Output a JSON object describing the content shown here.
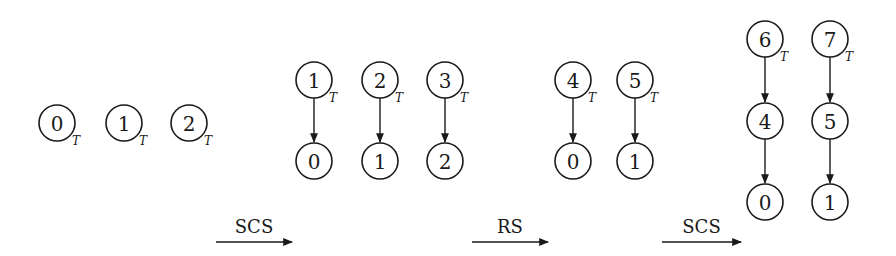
{
  "diagram": {
    "colors": {
      "stroke": "#1a1a1a",
      "fill": "#ffffff"
    },
    "node_radius": 18,
    "tag_text": "T",
    "stages": [
      {
        "name": "stage-0",
        "nodes": [
          {
            "id": "s0-n0",
            "label": "0",
            "x": 57,
            "y": 123,
            "tagged": true
          },
          {
            "id": "s0-n1",
            "label": "1",
            "x": 124,
            "y": 123,
            "tagged": true
          },
          {
            "id": "s0-n2",
            "label": "2",
            "x": 189,
            "y": 123,
            "tagged": true
          }
        ],
        "edges": []
      },
      {
        "name": "stage-1",
        "nodes": [
          {
            "id": "s1-n1",
            "label": "1",
            "x": 314,
            "y": 80,
            "tagged": true
          },
          {
            "id": "s1-n2",
            "label": "2",
            "x": 380,
            "y": 80,
            "tagged": true
          },
          {
            "id": "s1-n3",
            "label": "3",
            "x": 445,
            "y": 80,
            "tagged": true
          },
          {
            "id": "s1-n0",
            "label": "0",
            "x": 314,
            "y": 161,
            "tagged": false
          },
          {
            "id": "s1-n1b",
            "label": "1",
            "x": 380,
            "y": 161,
            "tagged": false
          },
          {
            "id": "s1-n2b",
            "label": "2",
            "x": 445,
            "y": 161,
            "tagged": false
          }
        ],
        "edges": [
          {
            "from": "s1-n1",
            "to": "s1-n0"
          },
          {
            "from": "s1-n2",
            "to": "s1-n1b"
          },
          {
            "from": "s1-n3",
            "to": "s1-n2b"
          }
        ]
      },
      {
        "name": "stage-2",
        "nodes": [
          {
            "id": "s2-n4",
            "label": "4",
            "x": 573,
            "y": 80,
            "tagged": true
          },
          {
            "id": "s2-n5",
            "label": "5",
            "x": 635,
            "y": 80,
            "tagged": true
          },
          {
            "id": "s2-n0",
            "label": "0",
            "x": 573,
            "y": 161,
            "tagged": false
          },
          {
            "id": "s2-n1",
            "label": "1",
            "x": 635,
            "y": 161,
            "tagged": false
          }
        ],
        "edges": [
          {
            "from": "s2-n4",
            "to": "s2-n0"
          },
          {
            "from": "s2-n5",
            "to": "s2-n1"
          }
        ]
      },
      {
        "name": "stage-3",
        "nodes": [
          {
            "id": "s3-n6",
            "label": "6",
            "x": 765,
            "y": 39,
            "tagged": true
          },
          {
            "id": "s3-n7",
            "label": "7",
            "x": 830,
            "y": 39,
            "tagged": true
          },
          {
            "id": "s3-n4",
            "label": "4",
            "x": 765,
            "y": 121,
            "tagged": false
          },
          {
            "id": "s3-n5",
            "label": "5",
            "x": 830,
            "y": 121,
            "tagged": false
          },
          {
            "id": "s3-n0",
            "label": "0",
            "x": 765,
            "y": 202,
            "tagged": false
          },
          {
            "id": "s3-n1",
            "label": "1",
            "x": 830,
            "y": 202,
            "tagged": false
          }
        ],
        "edges": [
          {
            "from": "s3-n6",
            "to": "s3-n4"
          },
          {
            "from": "s3-n4",
            "to": "s3-n0"
          },
          {
            "from": "s3-n7",
            "to": "s3-n5"
          },
          {
            "from": "s3-n5",
            "to": "s3-n1"
          }
        ]
      }
    ],
    "operations": [
      {
        "label": "SCS",
        "x1": 216,
        "x2": 292,
        "y": 242,
        "label_y": 233
      },
      {
        "label": "RS",
        "x1": 472,
        "x2": 548,
        "y": 242,
        "label_y": 233
      },
      {
        "label": "SCS",
        "x1": 662,
        "x2": 741,
        "y": 242,
        "label_y": 233
      }
    ]
  }
}
